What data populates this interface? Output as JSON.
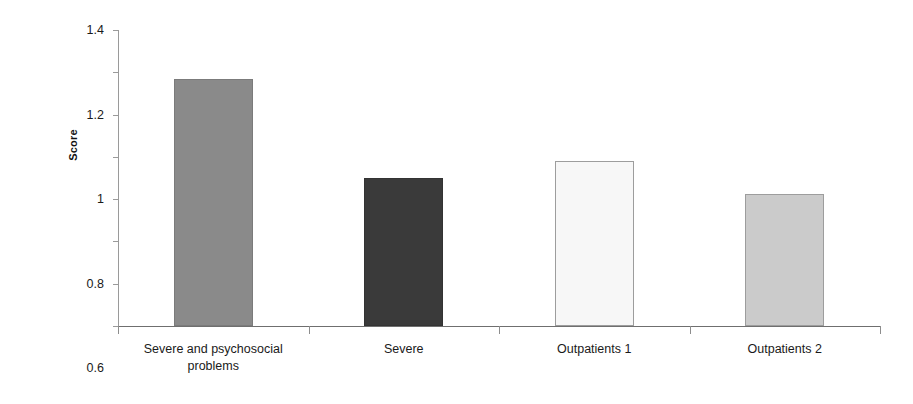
{
  "chart_data": {
    "type": "bar",
    "title": "",
    "xlabel": "",
    "ylabel": "Score",
    "categories": [
      "Severe and psychosocial problems",
      "Severe",
      "Outpatients 1",
      "Outpatients 2"
    ],
    "values": [
      1.17,
      0.7,
      0.78,
      0.625
    ],
    "ylim": [
      0,
      1.4
    ],
    "yticks": [
      "0",
      "0.2",
      "0.4",
      "0.6",
      "0.8",
      "1",
      "1.2",
      "1.4"
    ],
    "ytick_values": [
      0,
      0.2,
      0.4,
      0.6,
      0.8,
      1,
      1.2,
      1.4
    ],
    "grid": false,
    "legend": "none",
    "bar_colors": [
      "#8a8a8a",
      "#3a3a3a",
      "#f7f7f7",
      "#cbcbcb"
    ],
    "bar_border_colors": [
      "#7b7b7b",
      "#333333",
      "#9d9d9d",
      "#9d9d9d"
    ],
    "axis_color": "#8d8d8d"
  },
  "y_axis": {
    "title": "Score"
  },
  "categories": [
    {
      "line1": "Severe and psychosocial",
      "line2": "problems"
    },
    {
      "line1": "Severe",
      "line2": ""
    },
    {
      "line1": "Outpatients 1",
      "line2": ""
    },
    {
      "line1": "Outpatients 2",
      "line2": ""
    }
  ]
}
